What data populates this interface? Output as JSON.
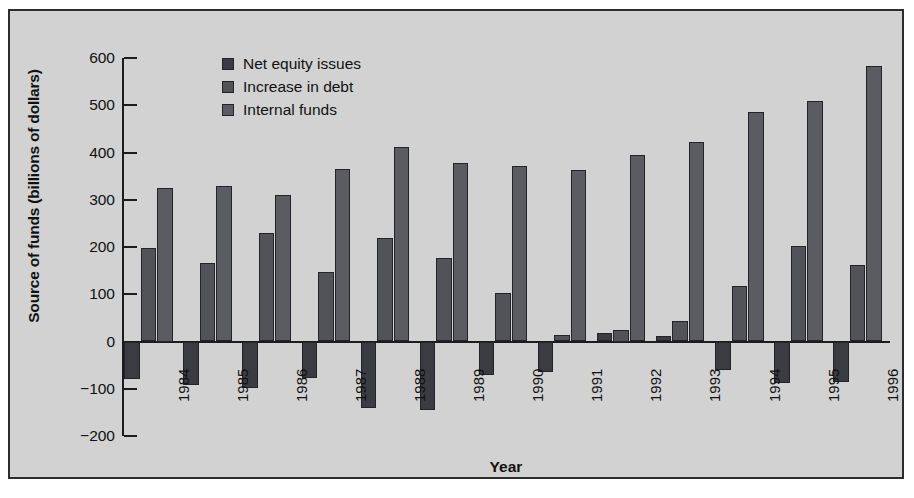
{
  "chart_data": {
    "type": "bar",
    "title": "",
    "xlabel": "Year",
    "ylabel": "Source of funds (billions of dollars)",
    "categories": [
      "1984",
      "1985",
      "1986",
      "1987",
      "1988",
      "1989",
      "1990",
      "1991",
      "1992",
      "1993",
      "1994",
      "1995",
      "1996"
    ],
    "series": [
      {
        "name": "Net equity issues",
        "color": "#3a3c42",
        "values": [
          -80,
          -93,
          -98,
          -78,
          -140,
          -145,
          -70,
          -65,
          18,
          12,
          -60,
          -88,
          -85
        ]
      },
      {
        "name": "Increase in debt",
        "color": "#515358",
        "values": [
          198,
          167,
          230,
          147,
          220,
          177,
          103,
          13,
          25,
          43,
          118,
          203,
          162
        ]
      },
      {
        "name": "Internal funds",
        "color": "#5a5c61",
        "values": [
          325,
          330,
          310,
          365,
          412,
          378,
          372,
          362,
          395,
          423,
          485,
          508,
          583
        ]
      }
    ],
    "ylim": [
      -200,
      600
    ],
    "yticks": [
      600,
      500,
      400,
      300,
      200,
      100,
      0,
      -100,
      -200
    ],
    "ytick_labels": [
      "600",
      "500",
      "400",
      "300",
      "200",
      "100",
      "0",
      "−100",
      "−200"
    ],
    "grid": false,
    "legend_position": "top-left"
  },
  "figure": {
    "panel_background": "#d2d2d2",
    "frame_color": "#2d2d2d"
  }
}
